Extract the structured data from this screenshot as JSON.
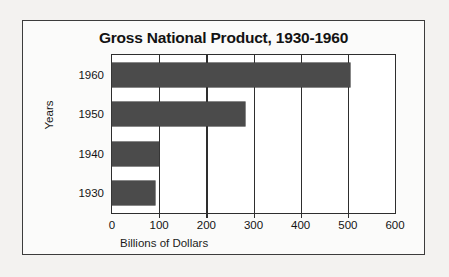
{
  "chart_data": {
    "type": "bar",
    "orientation": "horizontal",
    "title": "Gross National Product, 1930-1960",
    "xlabel": "Billions of Dollars",
    "ylabel": "Years",
    "categories": [
      "1960",
      "1950",
      "1940",
      "1930"
    ],
    "values": [
      505,
      283,
      100,
      91
    ],
    "xticks": [
      "0",
      "100",
      "200",
      "300",
      "400",
      "500",
      "600"
    ],
    "xtick_values": [
      0,
      100,
      200,
      300,
      400,
      500,
      600
    ],
    "xlim": [
      0,
      600
    ],
    "grid": "vertical",
    "legend": "none",
    "bar_color": "#4b4b4b",
    "axis_color": "#2e2e2e",
    "plot_background": "#ffffff",
    "figure_background": "#fbfbfa"
  }
}
